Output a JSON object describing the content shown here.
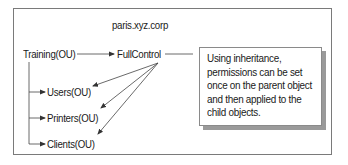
{
  "diagram": {
    "domain_label": "paris.xyz.corp",
    "parent": {
      "label": "Training(OU)"
    },
    "permission": {
      "label": "FullControl"
    },
    "children": [
      {
        "label": "Users(OU)"
      },
      {
        "label": "Printers(OU)"
      },
      {
        "label": "Clients(OU)"
      }
    ],
    "callout": {
      "lines": [
        "Using inheritance,",
        "permissions can be set",
        "once on the parent object",
        "and then applied to the",
        "child objects."
      ]
    },
    "colors": {
      "line": "#444444",
      "frame": "#7a7a7a",
      "shadow": "#9a9a9a"
    }
  }
}
